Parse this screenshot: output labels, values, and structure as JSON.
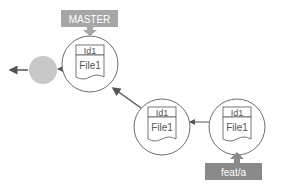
{
  "diagram": {
    "type": "git-commit-graph",
    "branches": [
      {
        "name": "MASTER",
        "color": "#a6a6a6",
        "points_to": "commit-1"
      },
      {
        "name": "feat/a",
        "color": "#8a8a8a",
        "points_to": "commit-3"
      }
    ],
    "commits": [
      {
        "id": "commit-1",
        "header": "Id1",
        "body": "File1"
      },
      {
        "id": "commit-2",
        "header": "Id1",
        "body": "File1"
      },
      {
        "id": "commit-3",
        "header": "Id1",
        "body": "File1"
      }
    ],
    "ancestor": {
      "fill": "#c8c8c8"
    },
    "colors": {
      "stroke": "#555555",
      "circle_stroke": "#6d6d6d",
      "label_text": "#ffffff"
    }
  }
}
